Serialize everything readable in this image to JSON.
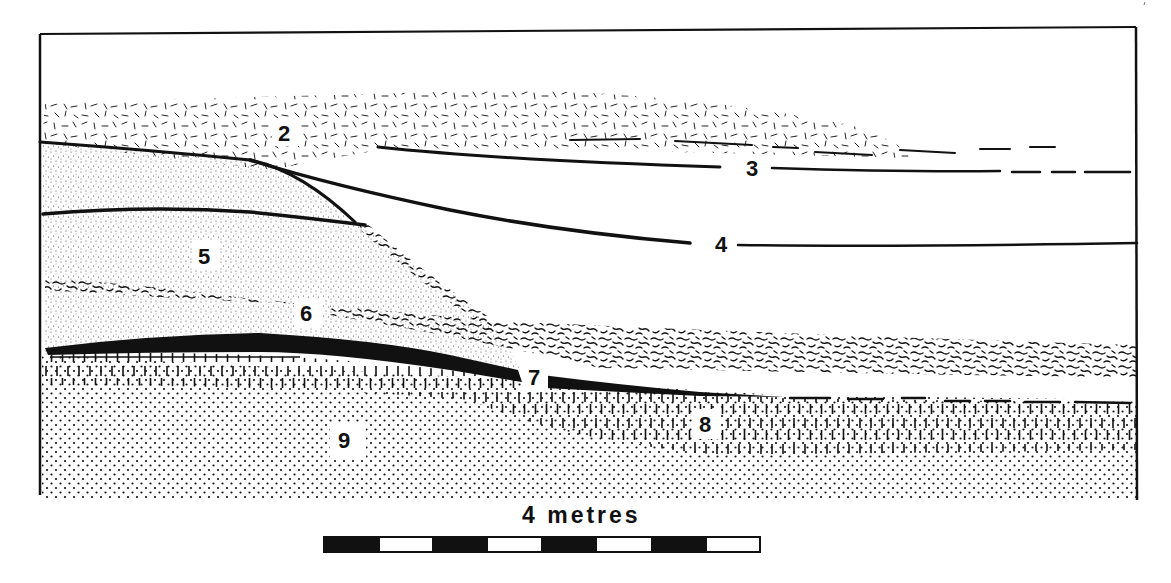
{
  "figure": {
    "type": "geological cross-section",
    "background": "#ffffff",
    "ink": "#111111"
  },
  "layers": [
    {
      "id": "2",
      "label": "2",
      "pattern": "dashes (scattered short strokes)",
      "label_pos": [
        285,
        133
      ]
    },
    {
      "id": "3",
      "label": "3",
      "pattern": "line boundary",
      "label_pos": [
        755,
        167
      ]
    },
    {
      "id": "4",
      "label": "4",
      "pattern": "line boundary",
      "label_pos": [
        723,
        244
      ]
    },
    {
      "id": "5",
      "label": "5",
      "pattern": "fine stipple",
      "label_pos": [
        205,
        256
      ]
    },
    {
      "id": "6",
      "label": "6",
      "pattern": "fine stipple with wavy streaks",
      "label_pos": [
        307,
        313
      ]
    },
    {
      "id": "7",
      "label": "7",
      "pattern": "solid black band",
      "label_pos": [
        535,
        377
      ]
    },
    {
      "id": "8",
      "label": "8",
      "pattern": "vertical ticks",
      "label_pos": [
        706,
        424
      ]
    },
    {
      "id": "9",
      "label": "9",
      "pattern": "coarse dots",
      "label_pos": [
        346,
        440
      ]
    }
  ],
  "scale_bar": {
    "label": "4 metres",
    "segments": 8,
    "segment_pattern": [
      "black",
      "white",
      "black",
      "white",
      "black",
      "white",
      "black",
      "white"
    ]
  }
}
